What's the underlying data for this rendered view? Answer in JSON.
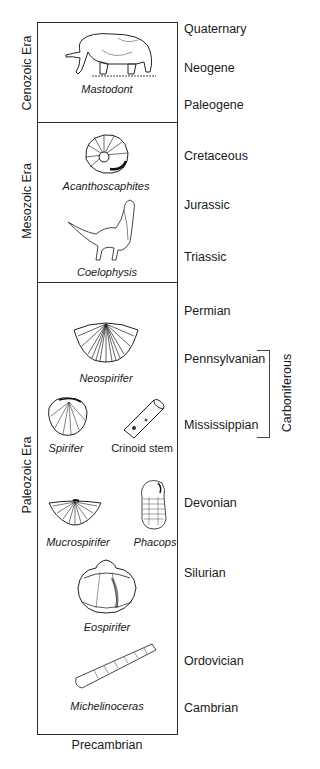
{
  "eras": [
    {
      "label": "Cenozoic Era",
      "top": 22,
      "bottom": 122
    },
    {
      "label": "Mesozoic Era",
      "top": 122,
      "bottom": 282
    },
    {
      "label": "Paleozoic Era",
      "top": 282,
      "bottom": 734
    }
  ],
  "periods": [
    {
      "label": "Quaternary",
      "y": 29
    },
    {
      "label": "Neogene",
      "y": 68
    },
    {
      "label": "Paleogene",
      "y": 105
    },
    {
      "label": "Cretaceous",
      "y": 156
    },
    {
      "label": "Jurassic",
      "y": 205
    },
    {
      "label": "Triassic",
      "y": 257
    },
    {
      "label": "Permian",
      "y": 311
    },
    {
      "label": "Pennsylvanian",
      "y": 359
    },
    {
      "label": "Mississippian",
      "y": 425
    },
    {
      "label": "Devonian",
      "y": 503
    },
    {
      "label": "Silurian",
      "y": 573
    },
    {
      "label": "Ordovician",
      "y": 661
    },
    {
      "label": "Cambrian",
      "y": 708
    }
  ],
  "subgroup": {
    "label": "Carboniferous",
    "spans": [
      "Pennsylvanian",
      "Mississippian"
    ]
  },
  "fossils": [
    {
      "label": "Mastodont",
      "era": "Cenozoic Era"
    },
    {
      "label": "Acanthoscaphites",
      "era": "Mesozoic Era"
    },
    {
      "label": "Coelophysis",
      "era": "Mesozoic Era"
    },
    {
      "label": "Neospirifer",
      "era": "Paleozoic Era"
    },
    {
      "label": "Spirifer",
      "era": "Paleozoic Era"
    },
    {
      "label": "Crinoid stem",
      "era": "Paleozoic Era"
    },
    {
      "label": "Mucrospirifer",
      "era": "Paleozoic Era"
    },
    {
      "label": "Phacops",
      "era": "Paleozoic Era"
    },
    {
      "label": "Eospirifer",
      "era": "Paleozoic Era"
    },
    {
      "label": "Michelinoceras",
      "era": "Paleozoic Era"
    }
  ],
  "base_label": "Precambrian",
  "colors": {
    "line": "#2a2a2a",
    "text": "#1a1a1a",
    "background": "#ffffff"
  }
}
